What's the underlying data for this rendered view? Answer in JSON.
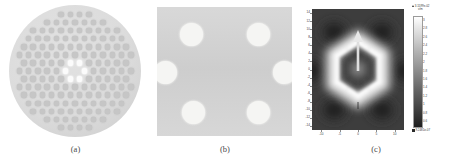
{
  "figure": {
    "panel_count": 3,
    "background_color": "#ffffff"
  },
  "panels": {
    "a": {
      "caption": "(a)",
      "description": "photonic crystal fiber cross-section",
      "shape": "disk",
      "lattice": "hexagonal",
      "disk_color": "#dcdcdc",
      "hole_color": "#c6c6c6",
      "bright_hole_color": "#fbfbfb",
      "lattice_rows": 13,
      "hole_spacing_px": 9.3,
      "hole_diameter_px": 5.4,
      "disk_diameter_px": 132,
      "bright_holes": 6,
      "bright_hole_ring_radius_px": 9.3
    },
    "b": {
      "caption": "(b)",
      "description": "magnified core region",
      "shape": "square",
      "background_color": "#d4d4d4",
      "hole_color": "#f5f5f3",
      "holes": [
        {
          "cx": 34,
          "cy": 27,
          "r": 11.5
        },
        {
          "cx": 101,
          "cy": 27,
          "r": 11.5
        },
        {
          "cx": 8,
          "cy": 65,
          "r": 11.5
        },
        {
          "cx": 127,
          "cy": 65,
          "r": 11.5
        },
        {
          "cx": 36,
          "cy": 105,
          "r": 11.5
        },
        {
          "cx": 101,
          "cy": 105,
          "r": 11.5
        }
      ]
    },
    "c": {
      "caption": "(c)",
      "description": "mode field intensity distribution",
      "arrow": {
        "label": "polarization-arrow",
        "direction": "up",
        "color": "#e6e6e6"
      }
    }
  },
  "chart_data": {
    "type": "heatmap",
    "title": "",
    "xlabel": "",
    "ylabel": "",
    "xticks": [
      "-10",
      "-5",
      "0",
      "5",
      "10"
    ],
    "yticks": [
      "14",
      "12",
      "10",
      "8",
      "6",
      "4",
      "2",
      "0",
      "-2",
      "-4",
      "-6",
      "-8",
      "-10",
      "-12",
      "-14"
    ],
    "xlim": [
      -13,
      13
    ],
    "ylim": [
      -15,
      15
    ],
    "grid": false,
    "colormap": "grayscale",
    "features": {
      "center_ring": "bright hexagonal ring",
      "dark_lobes": 6,
      "ring_outer_radius_px": 30,
      "ring_inner_radius_px": 20
    },
    "colorbar": {
      "position": "right",
      "orientation": "vertical",
      "max_label": "3.1599e-02",
      "max_label_unit": "v/m",
      "min_label": "9.2481e-07",
      "max_marker": "up-triangle",
      "min_marker": "square",
      "ticks": [
        "3",
        "2.8",
        "2.6",
        "2.4",
        "2.2",
        "2",
        "1.8",
        "1.6",
        "1.4",
        "1.2",
        "1",
        "0.8",
        "0.6"
      ]
    }
  }
}
